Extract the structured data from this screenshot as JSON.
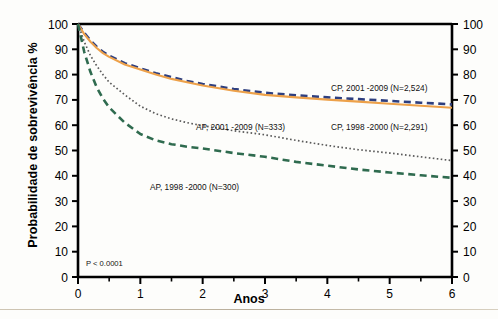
{
  "figure": {
    "xlabel": "Anos",
    "ylabel": "Probabilidade de sobrevivência %",
    "pvalue": "P < 0.0001"
  },
  "axes": {
    "y_ticks": [
      "0",
      "10",
      "20",
      "30",
      "40",
      "50",
      "60",
      "70",
      "80",
      "90",
      "100"
    ],
    "y_ticks_right": [
      "0",
      "10",
      "20",
      "30",
      "40",
      "50",
      "60",
      "70",
      "80",
      "90",
      "100"
    ],
    "x_ticks": [
      "0",
      "1",
      "2",
      "3",
      "4",
      "5",
      "6"
    ]
  },
  "annotations": {
    "cp_2001": "CP, 2001 -2009 (N=2,524)",
    "cp_1998": "CP, 1998 -2000 (N=2,291)",
    "ap_2001": "AP, 2001 -2009 (N=333)",
    "ap_1998": "AP, 1998 -2000 (N=300)"
  },
  "colors": {
    "cp_2001": "#2e3f7f",
    "cp_1998": "#eda14a",
    "ap_2001": "#5a5a5a",
    "ap_1998": "#2f6b4f",
    "axis": "#000000"
  },
  "chart_data": {
    "type": "line",
    "title": "",
    "xlabel": "Anos",
    "ylabel": "Probabilidade de sobrevivência %",
    "xlim": [
      0,
      6
    ],
    "ylim": [
      0,
      100
    ],
    "xtick_step": 1,
    "ytick_step": 10,
    "minor_xtick_step": 0.5,
    "grid": false,
    "legend": "inline-annotations",
    "annotation_text": "P < 0.0001",
    "x": [
      0,
      0.1,
      0.2,
      0.3,
      0.4,
      0.5,
      0.75,
      1,
      1.25,
      1.5,
      1.75,
      2,
      2.5,
      3,
      3.5,
      4,
      4.5,
      5,
      5.5,
      6
    ],
    "series": [
      {
        "name": "CP, 2001 -2009 (N=2,524)",
        "n": 2524,
        "style": "dashed",
        "color": "#2e3f7f",
        "values": [
          100,
          96.5,
          93.5,
          91,
          89,
          87.5,
          84.5,
          82.5,
          80.5,
          79,
          77.5,
          76.3,
          74.3,
          72.8,
          71.8,
          71,
          70.3,
          69.6,
          68.9,
          68.2
        ]
      },
      {
        "name": "CP, 1998 -2000 (N=2,291)",
        "n": 2291,
        "style": "solid",
        "color": "#eda14a",
        "values": [
          100,
          96,
          93,
          90.5,
          88.5,
          87,
          84,
          82,
          80,
          78.3,
          77,
          75.7,
          73.6,
          72,
          71,
          70.1,
          69.3,
          68.5,
          67.7,
          66.9
        ]
      },
      {
        "name": "AP, 2001 -2009 (N=333)",
        "n": 333,
        "style": "dotted",
        "color": "#5a5a5a",
        "values": [
          100,
          93,
          87.5,
          83.5,
          80,
          77,
          72,
          67.5,
          64.5,
          62.5,
          61,
          59.8,
          57.8,
          56.2,
          54,
          52,
          50.3,
          49,
          47.5,
          46
        ]
      },
      {
        "name": "AP, 1998 -2000 (N=300)",
        "n": 300,
        "style": "dashed",
        "color": "#2f6b4f",
        "values": [
          100,
          89,
          81,
          75,
          70.5,
          67,
          61,
          56.5,
          54,
          52.5,
          51.5,
          50.8,
          49,
          47.5,
          45.5,
          44,
          42.5,
          41.3,
          40.2,
          39.2
        ]
      }
    ]
  }
}
